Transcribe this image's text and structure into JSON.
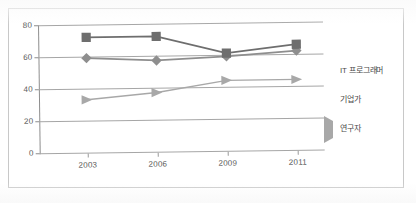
{
  "chart_data": {
    "type": "line",
    "title": "",
    "xlabel": "",
    "ylabel": "",
    "categories": [
      "2003",
      "2006",
      "2009",
      "2011"
    ],
    "ylim": [
      0,
      80
    ],
    "yticks": [
      0,
      20,
      40,
      60,
      80
    ],
    "grid": true,
    "legend_position": "right",
    "series": [
      {
        "name": "IT 프로그래머",
        "marker": "diamond",
        "color": "#8e8e8e",
        "values": [
          59,
          57,
          59,
          62
        ]
      },
      {
        "name": "기업가",
        "marker": "square",
        "color": "#6e6e6e",
        "values": [
          72,
          72,
          61,
          66
        ]
      },
      {
        "name": "연구자",
        "marker": "triangle",
        "color": "#a8a8a8",
        "values": [
          33,
          37,
          44,
          44
        ]
      }
    ]
  },
  "axis": {
    "y_labels": [
      "80",
      "60",
      "40",
      "20",
      "0"
    ],
    "x_labels": [
      "2003",
      "2006",
      "2009",
      "2011"
    ]
  },
  "legend": {
    "items": [
      {
        "label": "IT 프로그래머",
        "marker": "diamond-marker-icon"
      },
      {
        "label": "기업가",
        "marker": "square-marker-icon"
      },
      {
        "label": "연구자",
        "marker": "triangle-marker-icon"
      }
    ]
  },
  "colors": {
    "series_diamond": "#8e8e8e",
    "series_square": "#6e6e6e",
    "series_triangle": "#a8a8a8",
    "gridline": "#a6a6a6",
    "axis": "#8d8d8d",
    "text": "#5a5a5a",
    "frame": "#c8c8c8"
  }
}
